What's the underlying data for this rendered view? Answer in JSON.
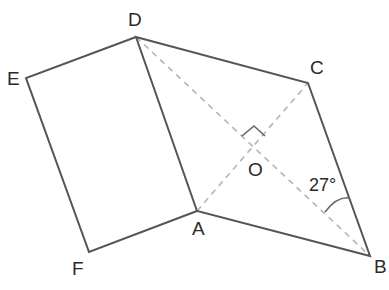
{
  "diagram": {
    "title": "",
    "points": {
      "D": {
        "label": "D",
        "x": 136,
        "y": 37
      },
      "C": {
        "label": "C",
        "x": 308,
        "y": 83
      },
      "A": {
        "label": "A",
        "x": 197,
        "y": 211
      },
      "B": {
        "label": "B",
        "x": 370,
        "y": 256
      },
      "E": {
        "label": "E",
        "x": 26,
        "y": 78
      },
      "F": {
        "label": "F",
        "x": 89,
        "y": 252
      },
      "O": {
        "label": "O",
        "x": 253,
        "y": 147
      }
    },
    "solid_segments": [
      "DC",
      "CB",
      "BA",
      "AD",
      "DE",
      "EF",
      "FA"
    ],
    "dashed_segments": [
      "DB",
      "AC"
    ],
    "annotations": {
      "right_angle_at": "O",
      "angle_label": "27°",
      "angle_at": "B",
      "angle_between": [
        "CB",
        "DB"
      ]
    },
    "colors": {
      "solid_line": "#555555",
      "dashed_line": "#b5b5b5",
      "text": "#2a2a2a"
    }
  }
}
